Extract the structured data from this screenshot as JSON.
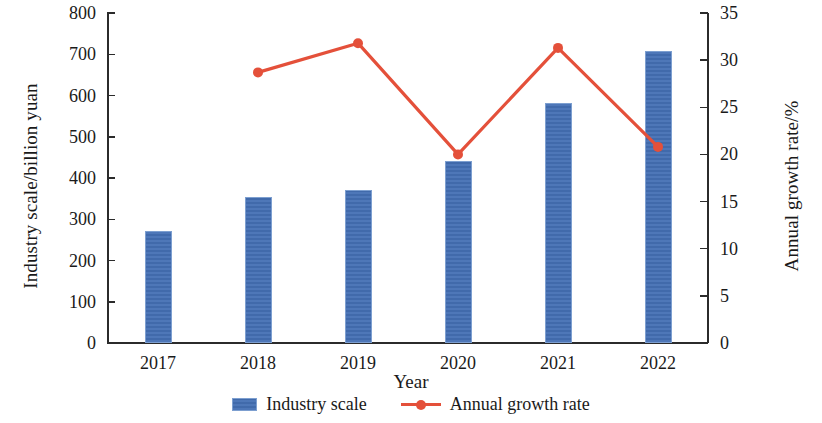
{
  "chart_data": {
    "type": "bar",
    "title": "",
    "xlabel": "Year",
    "categories": [
      "2017",
      "2018",
      "2019",
      "2020",
      "2021",
      "2022"
    ],
    "grid": false,
    "legend_position": "bottom",
    "axes": {
      "left": {
        "label": "Industry scale/billion yuan",
        "ylim": [
          0,
          800
        ],
        "ticks": [
          0,
          100,
          200,
          300,
          400,
          500,
          600,
          700,
          800
        ],
        "tick_labels": [
          "0",
          "100",
          "200",
          "300",
          "400",
          "500",
          "600",
          "700",
          "800"
        ]
      },
      "right": {
        "label": "Annual growth rate/%",
        "ylim": [
          0,
          35
        ],
        "ticks": [
          0,
          5,
          10,
          15,
          20,
          25,
          30,
          35
        ],
        "tick_labels": [
          "0",
          "5",
          "10",
          "15",
          "20",
          "25",
          "30",
          "35"
        ]
      }
    },
    "series": [
      {
        "name": "Industry scale",
        "type": "bar",
        "axis": "left",
        "color": "#4470b4",
        "values": [
          272,
          354,
          372,
          442,
          582,
          708
        ]
      },
      {
        "name": "Annual growth rate",
        "type": "line",
        "axis": "right",
        "color": "#e4503a",
        "marker": "circle",
        "values": [
          null,
          28.7,
          31.8,
          20.0,
          31.3,
          20.8
        ]
      }
    ]
  },
  "legend": [
    {
      "label": "Industry scale",
      "marker": "bar-swatch",
      "color": "#4470b4"
    },
    {
      "label": "Annual growth rate",
      "marker": "line-marker",
      "color": "#e4503a"
    }
  ]
}
